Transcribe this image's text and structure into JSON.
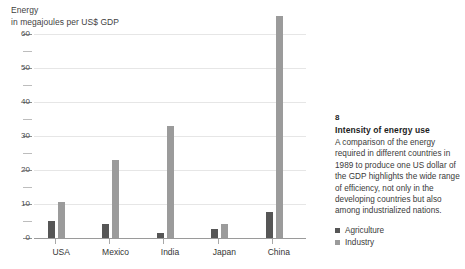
{
  "chart_data": {
    "type": "bar",
    "title": "Energy",
    "subtitle": "in megajoules per US$ GDP",
    "xlabel": "",
    "ylabel": "Energy in megajoules per US$ GDP",
    "ylim": [
      0,
      60
    ],
    "ytick_labels": [
      "0",
      "10",
      "20",
      "30",
      "40",
      "50",
      "60"
    ],
    "ytick_values": [
      0,
      10,
      20,
      30,
      40,
      50,
      60
    ],
    "minor_tick_values": [
      5,
      15,
      25,
      35,
      45,
      55
    ],
    "grid": true,
    "legend_position": "bottom-right",
    "categories": [
      "USA",
      "Mexico",
      "India",
      "Japan",
      "China"
    ],
    "series": [
      {
        "name": "Agriculture",
        "color": "#565656",
        "values": [
          5,
          4,
          1.5,
          2.5,
          7.5
        ]
      },
      {
        "name": "Industry",
        "color": "#9b9b9b",
        "values": [
          10.5,
          23,
          33,
          4,
          65
        ]
      }
    ]
  },
  "axis": {
    "title_line1": "Energy",
    "title_line2": "in megajoules per US$ GDP"
  },
  "legend": {
    "items": [
      {
        "label": "Agriculture"
      },
      {
        "label": "Industry"
      }
    ]
  },
  "caption": {
    "number": "8",
    "title": "Intensity of energy use",
    "body": "A comparison of the energy required in different countries in 1989 to produce one US dollar of the GDP highlights the wide range of efficiency, not only in the developing countries but also among industrialized nations."
  }
}
